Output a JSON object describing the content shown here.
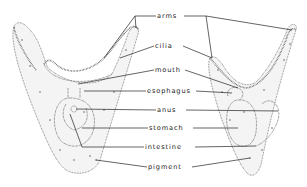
{
  "figure": {
    "type": "anatomical line drawing",
    "subject_count": 2,
    "labels": [
      {
        "id": "arms",
        "text": "arms",
        "x": 175,
        "y": 17
      },
      {
        "id": "cilia",
        "text": "cilia",
        "x": 175,
        "y": 48
      },
      {
        "id": "mouth",
        "text": "mouth",
        "x": 175,
        "y": 72
      },
      {
        "id": "esophagus",
        "text": "esophagus",
        "x": 175,
        "y": 93
      },
      {
        "id": "anus",
        "text": "anus",
        "x": 175,
        "y": 112
      },
      {
        "id": "stomach",
        "text": "stomach",
        "x": 175,
        "y": 130
      },
      {
        "id": "intestine",
        "text": "intestine",
        "x": 175,
        "y": 149
      },
      {
        "id": "pigment",
        "text": "pigment",
        "x": 175,
        "y": 169
      }
    ]
  },
  "colors": {
    "ink": "#222222",
    "stipple": "#777777",
    "background": "#ffffff"
  }
}
